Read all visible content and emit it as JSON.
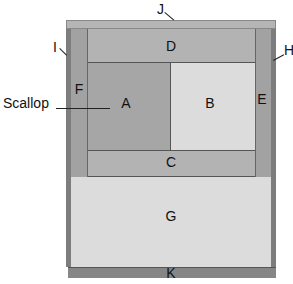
{
  "diagram": {
    "type": "quilt-block-layout",
    "pieces": [
      {
        "id": "J",
        "label": "J",
        "color": "#b5b5b5"
      },
      {
        "id": "I",
        "label": "I",
        "color": "#7d7d7d"
      },
      {
        "id": "H",
        "label": "H",
        "color": "#7d7d7d"
      },
      {
        "id": "F",
        "label": "F",
        "color": "#a2a2a2"
      },
      {
        "id": "E",
        "label": "E",
        "color": "#a2a2a2"
      },
      {
        "id": "D",
        "label": "D",
        "color": "#b3b3b3"
      },
      {
        "id": "A",
        "label": "A",
        "color": "#a6a6a6"
      },
      {
        "id": "B",
        "label": "B",
        "color": "#dcdcdc"
      },
      {
        "id": "C",
        "label": "C",
        "color": "#b3b3b3"
      },
      {
        "id": "G",
        "label": "G",
        "color": "#dcdcdc"
      },
      {
        "id": "K",
        "label": "K",
        "color": "#868686"
      }
    ],
    "callouts": {
      "scallop": "Scallop"
    },
    "edge_color": "#555555"
  }
}
